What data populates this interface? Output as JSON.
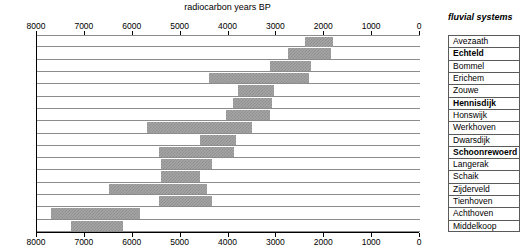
{
  "chart_data": {
    "type": "bar",
    "orientation": "horizontal-range",
    "title": "radiocarbon years BP",
    "xlabel": "radiocarbon years BP",
    "ylabel": "fluvial systems",
    "xlim": [
      8000,
      0
    ],
    "x_reversed": true,
    "xticks": [
      8000,
      7000,
      6000,
      5000,
      4000,
      3000,
      2000,
      1000,
      0
    ],
    "xtick_labels": [
      "8000",
      "7000",
      "6000",
      "5000",
      "4000",
      "3000",
      "2000",
      "1000",
      "0"
    ],
    "axis_positions": [
      "top",
      "bottom"
    ],
    "grid": true,
    "legend": null,
    "categories": [
      "Avezaath",
      "Echteld",
      "Bommel",
      "Erichem",
      "Zouwe",
      "Hennisdijk",
      "Honswijk",
      "Werkhoven",
      "Dwarsdijk",
      "Schoonrewoerd",
      "Langerak",
      "Schaik",
      "Zijderveld",
      "Tienhoven",
      "Achthoven",
      "Middelkoop"
    ],
    "bold_categories": [
      "Echteld",
      "Hennisdijk",
      "Schoonrewoerd"
    ],
    "bars": [
      {
        "label": "Avezaath",
        "start": 2400,
        "end": 1820,
        "bold": false
      },
      {
        "label": "Echteld",
        "start": 2750,
        "end": 1850,
        "bold": true
      },
      {
        "label": "Bommel",
        "start": 3130,
        "end": 2270,
        "bold": false
      },
      {
        "label": "Erichem",
        "start": 4400,
        "end": 2320,
        "bold": false
      },
      {
        "label": "Zouwe",
        "start": 3800,
        "end": 3050,
        "bold": false
      },
      {
        "label": "Hennisdijk",
        "start": 3900,
        "end": 3100,
        "bold": true
      },
      {
        "label": "Honswijk",
        "start": 4050,
        "end": 3130,
        "bold": false
      },
      {
        "label": "Werkhoven",
        "start": 5700,
        "end": 3500,
        "bold": false
      },
      {
        "label": "Dwarsdijk",
        "start": 4600,
        "end": 3850,
        "bold": false
      },
      {
        "label": "Schoonrewoerd",
        "start": 5450,
        "end": 3880,
        "bold": true
      },
      {
        "label": "Langerak",
        "start": 5420,
        "end": 4350,
        "bold": false
      },
      {
        "label": "Schaik",
        "start": 5400,
        "end": 4600,
        "bold": false
      },
      {
        "label": "Zijderveld",
        "start": 6500,
        "end": 4450,
        "bold": false
      },
      {
        "label": "Tienhoven",
        "start": 5450,
        "end": 4350,
        "bold": false
      },
      {
        "label": "Achthoven",
        "start": 7700,
        "end": 5850,
        "bold": false
      },
      {
        "label": "Middelkoop",
        "start": 7300,
        "end": 6200,
        "bold": false
      }
    ]
  },
  "header": {
    "chart_title": "radiocarbon years BP",
    "side_title": "fluvial systems"
  }
}
